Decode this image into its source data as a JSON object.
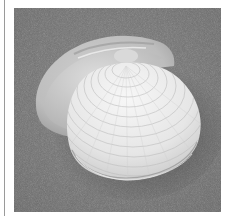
{
  "image": {
    "subject": "clam shell (bivalve) on gray textured background",
    "colors": {
      "page_background": "#ffffff",
      "edge_line": "#9a9a9a",
      "photo_background": "#747474",
      "shadow": "#4a4a4a",
      "shell_light": "#f2f2f2",
      "shell_mid": "#d6d6d6",
      "shell_dark": "#a9a9a9"
    }
  }
}
